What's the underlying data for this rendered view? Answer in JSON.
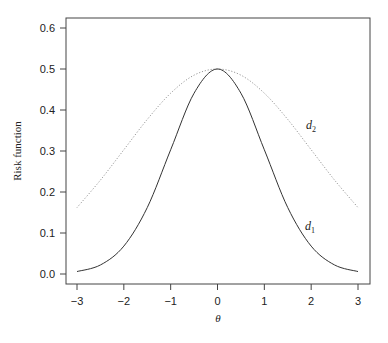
{
  "chart_data": {
    "type": "line",
    "title": "",
    "xlabel": "θ",
    "ylabel": "Risk function",
    "xlim": [
      -3,
      3
    ],
    "ylim": [
      0,
      0.6
    ],
    "x_ticks": [
      "−3",
      "−2",
      "−1",
      "0",
      "1",
      "2",
      "3"
    ],
    "y_ticks": [
      "0.0",
      "0.1",
      "0.2",
      "0.3",
      "0.4",
      "0.5",
      "0.6"
    ],
    "grid": false,
    "legend": "none (inline curve labels)",
    "x": [
      -3,
      -2.5,
      -2,
      -1.5,
      -1,
      -0.5,
      0,
      0.5,
      1,
      1.5,
      2,
      2.5,
      3
    ],
    "series": [
      {
        "name": "d1",
        "label_main": "d",
        "label_sub": "1",
        "style": "solid",
        "color": "#333333",
        "values": [
          0.006,
          0.022,
          0.068,
          0.162,
          0.303,
          0.441,
          0.5,
          0.441,
          0.303,
          0.162,
          0.068,
          0.022,
          0.006
        ]
      },
      {
        "name": "d2",
        "label_main": "d",
        "label_sub": "2",
        "style": "dotted",
        "color": "#888888",
        "values": [
          0.162,
          0.229,
          0.303,
          0.377,
          0.441,
          0.485,
          0.5,
          0.485,
          0.441,
          0.377,
          0.303,
          0.229,
          0.162
        ]
      }
    ]
  }
}
